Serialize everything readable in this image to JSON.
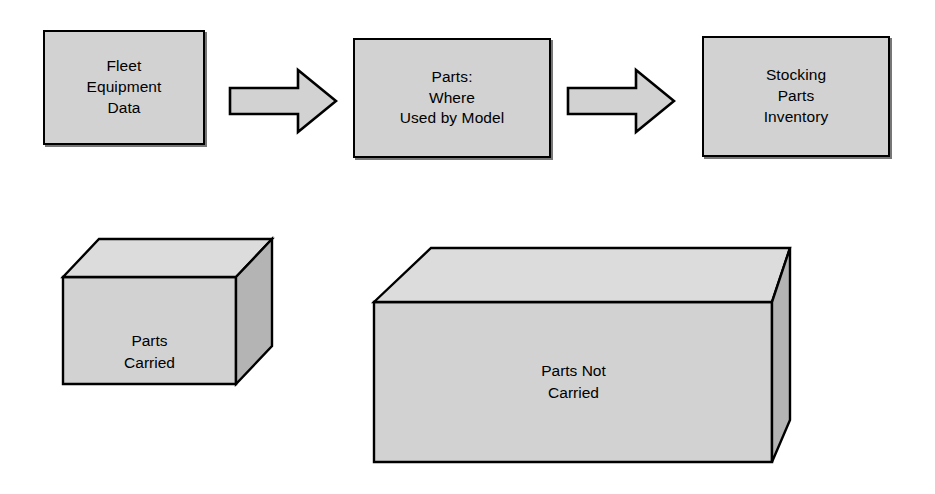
{
  "diagram": {
    "colors": {
      "face_front": "#d2d2d2",
      "face_top": "#dcdcdc",
      "face_side": "#b4b4b4",
      "outline": "#000000",
      "shadow": "#777777",
      "background": "#ffffff"
    },
    "process_boxes": [
      {
        "id": "fleet-equipment-data",
        "label": "Fleet\nEquipment\nData"
      },
      {
        "id": "parts-where-used-by-model",
        "label": "Parts:\nWhere\nUsed by Model"
      },
      {
        "id": "stocking-parts-inventory",
        "label": "Stocking\nParts\nInventory"
      }
    ],
    "arrows": [
      {
        "id": "arrow-fleet-to-parts",
        "icon": "right-block-arrow-icon",
        "direction": "right"
      },
      {
        "id": "arrow-parts-to-stocking",
        "icon": "right-block-arrow-icon",
        "direction": "right"
      }
    ],
    "volumes": [
      {
        "id": "parts-carried",
        "label": "Parts\nCarried",
        "relative_size": "small"
      },
      {
        "id": "parts-not-carried",
        "label": "Parts Not\nCarried",
        "relative_size": "large"
      }
    ]
  }
}
